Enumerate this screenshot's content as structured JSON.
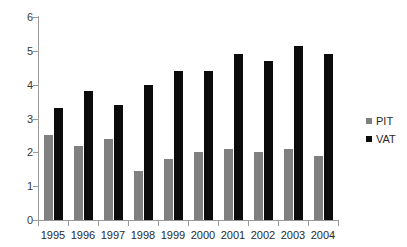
{
  "chart_data": {
    "type": "bar",
    "title": "",
    "subtitle": "",
    "xlabel": "",
    "ylabel": "",
    "categories": [
      "1995",
      "1996",
      "1997",
      "1998",
      "1999",
      "2000",
      "2001",
      "2002",
      "2003",
      "2004"
    ],
    "series": [
      {
        "name": "PIT",
        "color": "#808080",
        "values": [
          2.5,
          2.2,
          2.4,
          1.45,
          1.8,
          2.0,
          2.1,
          2.0,
          2.1,
          1.9
        ]
      },
      {
        "name": "VAT",
        "color": "#0b0b0b",
        "values": [
          3.3,
          3.8,
          3.4,
          4.0,
          4.4,
          4.4,
          4.9,
          4.7,
          5.15,
          4.9
        ]
      }
    ],
    "ylim": [
      0,
      6
    ],
    "y_ticks": [
      "0",
      "1",
      "2",
      "3",
      "4",
      "5",
      "6"
    ],
    "grid": false,
    "legend_position": "right"
  },
  "legend": {
    "entries": [
      {
        "label": "PIT",
        "color": "#808080"
      },
      {
        "label": "VAT",
        "color": "#0b0b0b"
      }
    ]
  },
  "axis": {
    "line_color": "#9a9a9a",
    "tick_color": "#9a9a9a"
  },
  "background": "#ffffff"
}
